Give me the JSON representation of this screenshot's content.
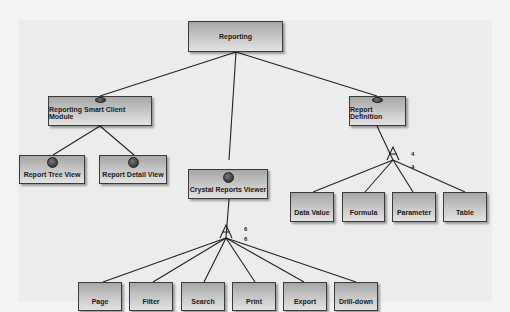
{
  "diagram": {
    "root": {
      "label": "Reporting"
    },
    "nodes": [
      {
        "id": "rscm",
        "label": "Reporting Smart Client Module",
        "feature_marker": true
      },
      {
        "id": "rtv",
        "label": "Report Tree View",
        "feature_marker": true
      },
      {
        "id": "rdv",
        "label": "Report Detail View",
        "feature_marker": true
      },
      {
        "id": "crv",
        "label": "Crystal Reports Viewer",
        "feature_marker": true
      },
      {
        "id": "rd",
        "label": "Report Definition",
        "feature_marker": true
      },
      {
        "id": "page",
        "label": "Page"
      },
      {
        "id": "filter",
        "label": "Filter"
      },
      {
        "id": "search",
        "label": "Search"
      },
      {
        "id": "print",
        "label": "Print"
      },
      {
        "id": "export",
        "label": "Export"
      },
      {
        "id": "drill",
        "label": "Drill-down"
      },
      {
        "id": "dv",
        "label": "Data Value"
      },
      {
        "id": "formula",
        "label": "Formula"
      },
      {
        "id": "param",
        "label": "Parameter"
      },
      {
        "id": "table",
        "label": "Table"
      }
    ],
    "cardinalities": {
      "crv_upper": "6",
      "crv_lower": "6",
      "rd_upper": "4",
      "rd_lower": "4"
    }
  }
}
